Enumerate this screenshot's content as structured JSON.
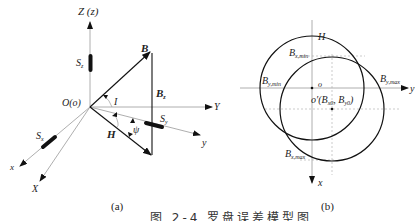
{
  "figure": {
    "caption": "图 2-4  罗盘误差模型图",
    "caption_note": "caption clipped at bottom edge"
  },
  "panel_a": {
    "label": "(a)",
    "axes": {
      "Z": "Z (z)",
      "Y": "Y",
      "y": "y",
      "X": "X",
      "x": "x"
    },
    "origin": "O(o)",
    "vectors": {
      "B": "B",
      "Bz": "B",
      "Bz_sub": "z",
      "H": "H"
    },
    "angles": {
      "inclination": "I",
      "heading": "ψ"
    },
    "sensors": {
      "Sz": "S",
      "Sz_sub": "z",
      "Sy": "S",
      "Sy_sub": "y",
      "Sx": "S",
      "Sx_sub": "x"
    }
  },
  "panel_b": {
    "label": "(b)",
    "axes": {
      "y": "y",
      "x": "x"
    },
    "origin": "o",
    "circle_label": "H",
    "center_label": "o′(B",
    "center_sub1": "x0",
    "center_mid": ", B",
    "center_sub2": "y0",
    "center_end": ")",
    "points": {
      "bx_min": "B",
      "bx_min_sub": "x,min",
      "by_min": "B",
      "by_min_sub": "y,min",
      "by_max": "B",
      "by_max_sub": "y,max",
      "bx_max": "B",
      "bx_max_sub": "x,max"
    }
  }
}
